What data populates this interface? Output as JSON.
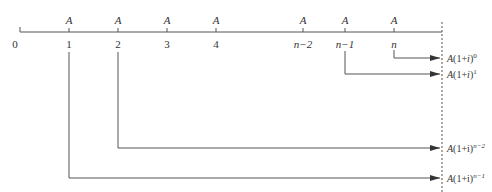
{
  "diagram": {
    "payment_label": "A",
    "timeline": {
      "ticks": [
        {
          "label": "0",
          "x": 20,
          "italic": false,
          "payment": false
        },
        {
          "label": "1",
          "x": 69,
          "italic": false,
          "payment": true
        },
        {
          "label": "2",
          "x": 118,
          "italic": false,
          "payment": true
        },
        {
          "label": "3",
          "x": 167,
          "italic": false,
          "payment": true
        },
        {
          "label": "4",
          "x": 216,
          "italic": false,
          "payment": true
        },
        {
          "label": "n−2",
          "x": 303,
          "italic": true,
          "payment": true
        },
        {
          "label": "n−1",
          "x": 345,
          "italic": true,
          "payment": true
        },
        {
          "label": "n",
          "x": 394,
          "italic": true,
          "payment": true
        }
      ]
    },
    "flows": [
      {
        "from_label": "n",
        "from_x": 394,
        "y": 58,
        "value_prefix": "A(1+",
        "value_var": "i",
        "value_suffix": ")",
        "exponent": "0"
      },
      {
        "from_label": "n−1",
        "from_x": 345,
        "y": 74,
        "value_prefix": "A(1+",
        "value_var": "i",
        "value_suffix": ")",
        "exponent": "1"
      },
      {
        "from_label": "2",
        "from_x": 118,
        "y": 148,
        "value_prefix": "A(1+",
        "value_var": "i",
        "value_suffix": ")",
        "exponent": "n−2"
      },
      {
        "from_label": "1",
        "from_x": 69,
        "y": 178,
        "value_prefix": "A(1+",
        "value_var": "i",
        "value_suffix": ")",
        "exponent": "n−1"
      }
    ],
    "labels": {
      "t0": "0",
      "t1": "1",
      "t2": "2",
      "t3": "3",
      "t4": "4",
      "tn2": "n−2",
      "tn1": "n−1",
      "tn": "n",
      "a": "A",
      "fv0_prefix": "A(1+",
      "fv0_var": "i",
      "fv0_suffix": ")",
      "fv0_exp": "0",
      "fv1_prefix": "A(1+",
      "fv1_var": "i",
      "fv1_suffix": ")",
      "fv1_exp": "1",
      "fv2_prefix": "A(1+i)",
      "fv2_exp": "n−2",
      "fv3_prefix": "A(1+i)",
      "fv3_exp": "n−1"
    },
    "colors": {
      "line": "#555555",
      "dashed": "#555555",
      "text": "#333333"
    }
  }
}
